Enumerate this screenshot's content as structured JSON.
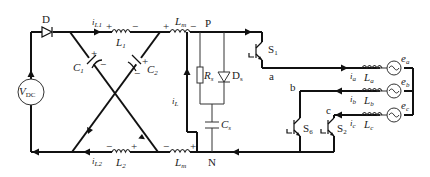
{
  "diagram": {
    "type": "circuit-schematic",
    "components": {
      "diode_main": "D",
      "source": {
        "label": "V",
        "sub": "DC"
      },
      "L1": {
        "label": "L",
        "sub": "1"
      },
      "L2": {
        "label": "L",
        "sub": "2"
      },
      "Lm_top": {
        "label": "L",
        "sub": "m"
      },
      "Lm_bottom": {
        "label": "L",
        "sub": "m"
      },
      "C1": {
        "label": "C",
        "sub": "1"
      },
      "C2": {
        "label": "C",
        "sub": "2"
      },
      "Rs": {
        "label": "R",
        "sub": "s"
      },
      "Ds": {
        "label": "D",
        "sub": "s"
      },
      "Cs": {
        "label": "C",
        "sub": "s"
      },
      "S1": {
        "label": "S",
        "sub": "1"
      },
      "S6": {
        "label": "S",
        "sub": "6"
      },
      "S2": {
        "label": "S",
        "sub": "2"
      },
      "La": {
        "label": "L",
        "sub": "a"
      },
      "Lb": {
        "label": "L",
        "sub": "b"
      },
      "Lc": {
        "label": "L",
        "sub": "c"
      },
      "ea": {
        "label": "e",
        "sub": "a"
      },
      "eb": {
        "label": "e",
        "sub": "b"
      },
      "ec": {
        "label": "e",
        "sub": "c"
      }
    },
    "currents": {
      "iL1": {
        "label": "i",
        "sub": "L1"
      },
      "iL2": {
        "label": "i",
        "sub": "L2"
      },
      "iL": {
        "label": "i",
        "sub": "L"
      },
      "ia": {
        "label": "i",
        "sub": "a"
      },
      "ib": {
        "label": "i",
        "sub": "b"
      },
      "ic": {
        "label": "i",
        "sub": "c"
      }
    },
    "nodes": {
      "P": "P",
      "N": "N",
      "a": "a",
      "b": "b",
      "c": "c"
    },
    "polarity": {
      "plus": "+",
      "minus": "−"
    }
  }
}
